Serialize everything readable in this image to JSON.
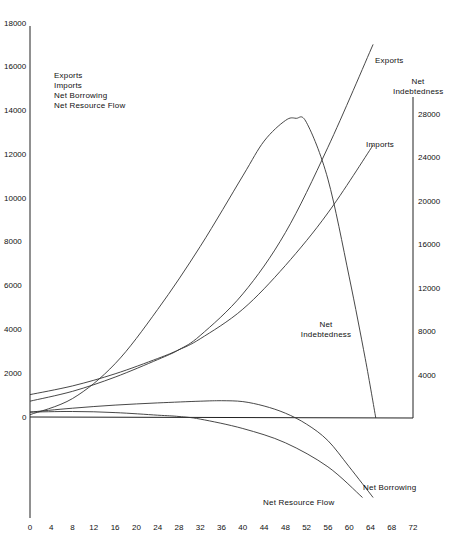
{
  "chart_data": {
    "type": "line",
    "title": "",
    "xlabel": "",
    "x_ticks": [
      0,
      4,
      8,
      12,
      16,
      20,
      24,
      28,
      32,
      36,
      40,
      44,
      48,
      52,
      56,
      60,
      64,
      68,
      72
    ],
    "xlim": [
      0,
      72
    ],
    "left_axis": {
      "label_lines": [
        "Exports",
        "Imports",
        "Net Borrowing",
        "Net Resource Flow"
      ],
      "ticks": [
        0,
        2000,
        4000,
        6000,
        8000,
        10000,
        12000,
        14000,
        16000,
        18000
      ],
      "ylim": [
        0,
        18000
      ]
    },
    "right_axis": {
      "label_lines": [
        "Net",
        "Indebtedness"
      ],
      "ticks": [
        4000,
        8000,
        12000,
        16000,
        20000,
        24000,
        28000
      ],
      "ylim": [
        0,
        28000
      ]
    },
    "grid": false,
    "series": [
      {
        "name": "Exports",
        "axis": "left",
        "x": [
          0,
          8,
          16,
          24,
          28,
          32,
          40,
          48,
          56,
          64.5
        ],
        "values": [
          700,
          1150,
          1800,
          2600,
          3050,
          3700,
          5600,
          8400,
          12300,
          17000
        ]
      },
      {
        "name": "Imports",
        "axis": "left",
        "x": [
          0,
          8,
          16,
          24,
          28,
          32,
          40,
          48,
          56,
          64.5
        ],
        "values": [
          1000,
          1400,
          1950,
          2650,
          3050,
          3550,
          4900,
          6900,
          9300,
          12400
        ]
      },
      {
        "name": "Net Borrowing",
        "axis": "left",
        "x": [
          0,
          8,
          16,
          24,
          32,
          36,
          40,
          44,
          48,
          52,
          56,
          60,
          64.5
        ],
        "values": [
          200,
          380,
          520,
          620,
          700,
          720,
          680,
          480,
          150,
          -350,
          -1100,
          -2300,
          -3700
        ]
      },
      {
        "name": "Net Resource Flow",
        "axis": "left",
        "x": [
          0,
          8,
          16,
          24,
          28,
          32,
          40,
          48,
          56,
          62.5
        ],
        "values": [
          200,
          230,
          180,
          60,
          0,
          -120,
          -550,
          -1200,
          -2300,
          -3700
        ]
      },
      {
        "name": "Net Indebtedness",
        "axis": "right",
        "x": [
          0,
          8,
          16,
          24,
          32,
          40,
          44,
          48,
          50,
          52,
          56,
          60,
          63,
          65
        ],
        "values": [
          300,
          1800,
          5000,
          10000,
          15800,
          22300,
          25500,
          27400,
          27600,
          27200,
          22000,
          13000,
          5500,
          0
        ]
      }
    ],
    "annotations": [
      {
        "text": "Exports",
        "near": "end of Exports curve"
      },
      {
        "text": "Imports",
        "near": "end of Imports curve"
      },
      {
        "text": "Net Indebtedness",
        "near": "center-right, below peak"
      },
      {
        "text": "Net Borrowing",
        "near": "end of Net Borrowing curve"
      },
      {
        "text": "Net Resource Flow",
        "near": "end of Net Resource Flow curve"
      }
    ]
  },
  "labels": {
    "left_axis_title": [
      "Exports",
      "Imports",
      "Net Borrowing",
      "Net Resource Flow"
    ],
    "right_axis_title": [
      "Net",
      "Indebtedness"
    ],
    "exports_curve": "Exports",
    "imports_curve": "Imports",
    "net_indebtedness_curve": [
      "Net",
      "Indebtedness"
    ],
    "net_borrowing_curve": "Net Borrowing",
    "net_resource_flow_curve": "Net Resource Flow"
  }
}
